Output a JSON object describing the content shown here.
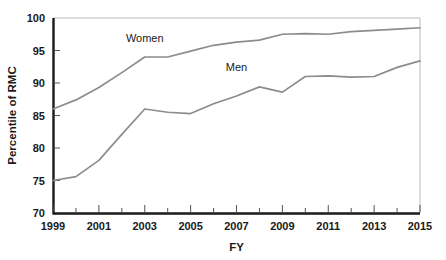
{
  "chart_data": {
    "type": "line",
    "title": "",
    "xlabel": "FY",
    "ylabel": "Percentile of RMC",
    "xlim": [
      1999,
      2015
    ],
    "ylim": [
      70,
      100
    ],
    "grid": false,
    "legend_position": "inline-labels",
    "x": [
      1999,
      2000,
      2001,
      2002,
      2003,
      2004,
      2005,
      2006,
      2007,
      2008,
      2009,
      2010,
      2011,
      2012,
      2013,
      2014,
      2015
    ],
    "xticklabels": [
      "1999",
      "2001",
      "2003",
      "2005",
      "2007",
      "2009",
      "2011",
      "2013",
      "2015"
    ],
    "xtickvalues": [
      1999,
      2001,
      2003,
      2005,
      2007,
      2009,
      2011,
      2013,
      2015
    ],
    "xminorticks": [
      2000,
      2002,
      2004,
      2006,
      2008,
      2010,
      2012,
      2014
    ],
    "yticklabels": [
      "70",
      "75",
      "80",
      "85",
      "90",
      "95",
      "100"
    ],
    "ytickvalues": [
      70,
      75,
      80,
      85,
      90,
      95,
      100
    ],
    "series": [
      {
        "name": "Women",
        "color": "#8c8c8c",
        "label_x": 2003.0,
        "label_y": 96.3,
        "values": [
          86.0,
          87.4,
          89.3,
          91.6,
          94.0,
          94.0,
          94.9,
          95.8,
          96.3,
          96.6,
          97.5,
          97.6,
          97.5,
          97.9,
          98.1,
          98.3,
          98.5
        ]
      },
      {
        "name": "Men",
        "color": "#8c8c8c",
        "label_x": 2007.0,
        "label_y": 91.9,
        "values": [
          75.0,
          75.6,
          78.1,
          82.1,
          86.0,
          85.5,
          85.3,
          86.8,
          88.0,
          89.4,
          88.6,
          91.0,
          91.1,
          90.9,
          91.0,
          92.4,
          93.4
        ]
      }
    ]
  },
  "layout": {
    "plot_left": 53,
    "plot_right": 420,
    "plot_top": 18,
    "plot_bottom": 213
  }
}
